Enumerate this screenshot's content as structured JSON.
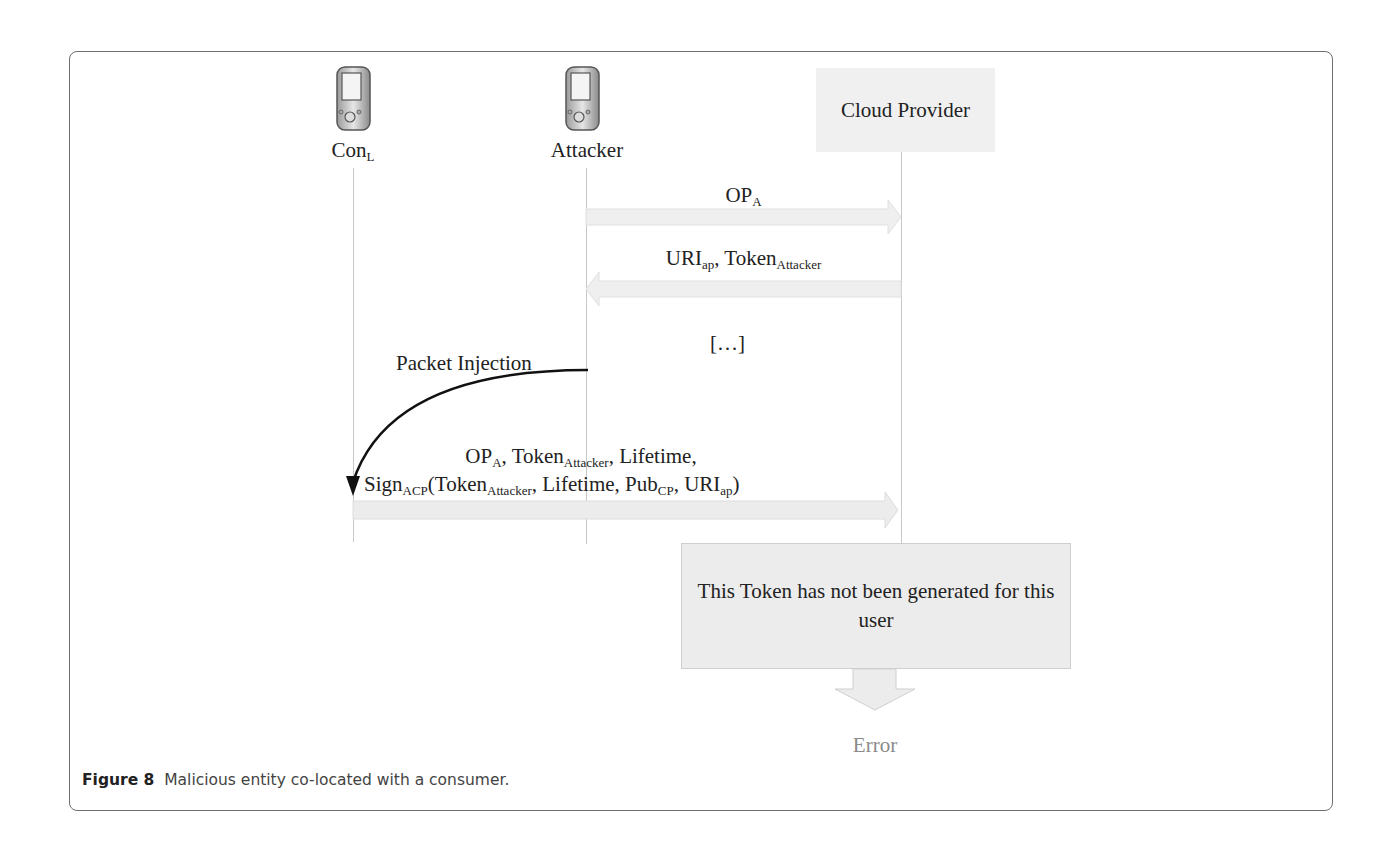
{
  "figure": {
    "caption_label": "Figure 8",
    "caption_text": "Malicious entity co-located with a consumer."
  },
  "actors": [
    {
      "id": "con_l",
      "label": "Con",
      "label_sub": "L",
      "icon": "pda-device-icon"
    },
    {
      "id": "attacker",
      "label": "Attacker",
      "icon": "pda-device-icon"
    },
    {
      "id": "cloud_provider",
      "label": "Cloud Provider"
    }
  ],
  "messages": [
    {
      "id": "m1",
      "from": "attacker",
      "to": "cloud_provider",
      "parts": {
        "a": "OP",
        "a_sub": "A"
      }
    },
    {
      "id": "m2",
      "from": "cloud_provider",
      "to": "attacker",
      "parts": {
        "a": "URI",
        "a_sub": "ap",
        "b": ", Token",
        "b_sub": "Attacker"
      }
    },
    {
      "id": "ellipsis",
      "text": "[…]"
    },
    {
      "id": "m3",
      "from": "con_l",
      "to": "cloud_provider",
      "line1": {
        "a": "OP",
        "a_sub": "A",
        "b": ", Token",
        "b_sub": "Attacker",
        "c": ", Lifetime,"
      },
      "line2": {
        "a": "Sign",
        "a_sub": "ACP",
        "b": "(Token",
        "b_sub": "Attacker",
        "c": ", Lifetime, Pub",
        "c_sub": "CP",
        "d": ",  URI",
        "d_sub": "ap",
        "e": ")"
      }
    }
  ],
  "injection": {
    "label": "Packet Injection",
    "from": "attacker",
    "to": "con_l"
  },
  "outcome": {
    "box_text": "This Token has not been generated for this user",
    "result_label": "Error"
  },
  "colors": {
    "frame": "#6e6e6e",
    "arrow_fill": "#eeeeee",
    "box_fill": "#ececec",
    "error_text": "#8a8a8a"
  }
}
